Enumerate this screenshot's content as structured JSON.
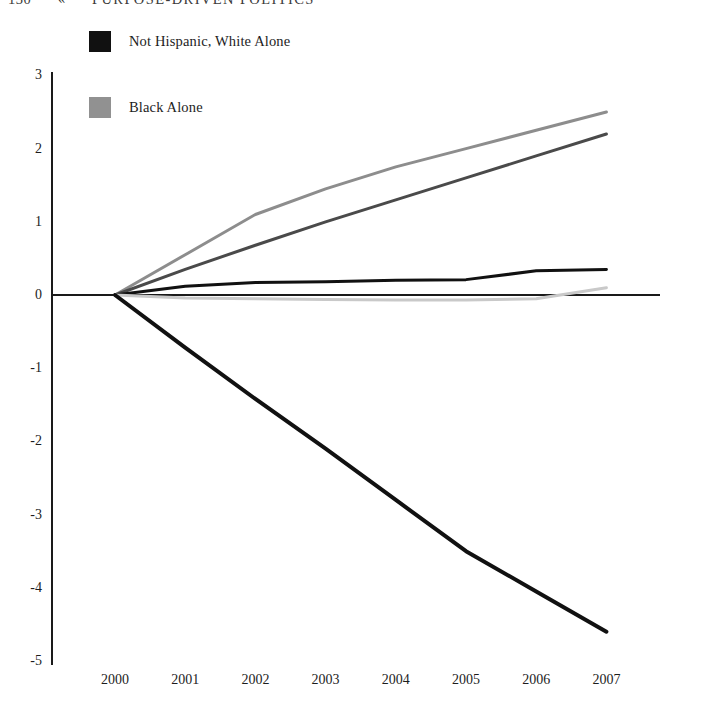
{
  "page": {
    "folio": "130",
    "guillemet": "«",
    "running_title": "PURPOSE-DRIVEN POLITICS"
  },
  "legend": {
    "position": "top-left",
    "entries": [
      {
        "label": "Not Hispanic, White Alone",
        "color": "#111111",
        "swatch_name": "legend-swatch-black"
      },
      {
        "label": "Black Alone",
        "color": "#919191",
        "swatch_name": "legend-swatch-gray"
      }
    ]
  },
  "axes": {
    "y_ticks": [
      "3",
      "2",
      "1",
      "0",
      "-1",
      "-2",
      "-3",
      "-4",
      "-5"
    ],
    "x_ticks": [
      "2000",
      "2001",
      "2002",
      "2003",
      "2004",
      "2005",
      "2006",
      "2007"
    ],
    "axis_color": "#1a1a1a"
  },
  "chart_data": {
    "type": "line",
    "title": "",
    "subtitle": "",
    "xlabel": "",
    "ylabel": "",
    "x": [
      2000,
      2001,
      2002,
      2003,
      2004,
      2005,
      2006,
      2007
    ],
    "xlim": [
      2000,
      2007
    ],
    "ylim": [
      -5,
      3
    ],
    "grid": false,
    "legend_position": "top-left",
    "zero_line": true,
    "series": [
      {
        "name": "Series A (rising, light gray)",
        "color": "#8d8d8d",
        "width": 3,
        "values": [
          0.0,
          0.55,
          1.1,
          1.45,
          1.75,
          2.0,
          2.25,
          2.5
        ]
      },
      {
        "name": "Series B (rising, dark gray)",
        "color": "#4a4a4a",
        "width": 3,
        "values": [
          0.0,
          0.35,
          0.68,
          1.0,
          1.3,
          1.6,
          1.9,
          2.2
        ]
      },
      {
        "name": "Not Hispanic, White Alone (flat, black)",
        "color": "#111111",
        "width": 3,
        "values": [
          0.0,
          0.12,
          0.17,
          0.18,
          0.2,
          0.21,
          0.33,
          0.35
        ]
      },
      {
        "name": "Black Alone (flat, pale gray)",
        "color": "#c9c9c9",
        "width": 3,
        "values": [
          0.0,
          -0.04,
          -0.05,
          -0.06,
          -0.07,
          -0.07,
          -0.05,
          0.1
        ]
      },
      {
        "name": "Series E (declining, heavy black)",
        "color": "#111111",
        "width": 4,
        "values": [
          0.0,
          -0.72,
          -1.42,
          -2.1,
          -2.8,
          -3.5,
          -4.05,
          -4.6
        ]
      }
    ]
  }
}
